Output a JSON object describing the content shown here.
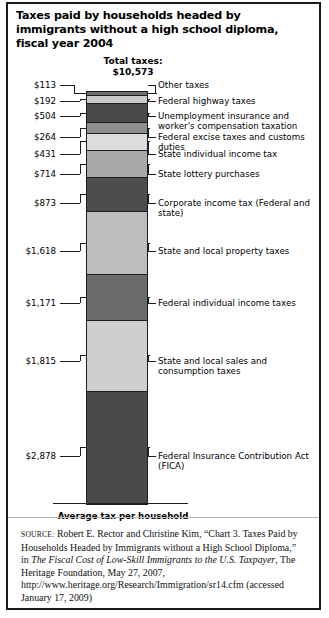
{
  "figure": {
    "title": "Taxes paid by households headed by immigrants without a high school diploma, fiscal year 2004",
    "total_label": "Total taxes:",
    "total_value": "$10,573",
    "axis_caption": "Average tax per household"
  },
  "source": {
    "keyword": "SOURCE:",
    "text_1": " Robert E. Rector and Christine Kim, “Chart 3. Taxes Paid by Households Headed by Immigrants without a High School Diploma,” in ",
    "italic": "The Fiscal Cost of Low-Skill Immigrants to the U.S. Taxpayer",
    "text_2": ", The Heritage Foundation, May 27, 2007, http://www.heritage.org/Research/Immigration/sr14.cfm (accessed January 17, 2009)"
  },
  "chart_data": {
    "type": "bar",
    "subtype": "stacked-single-column",
    "title": "Taxes paid by households headed by immigrants without a high school diploma, fiscal year 2004",
    "xlabel": "Average tax per household",
    "ylabel": "",
    "units": "US dollars per household per year",
    "total": 10573,
    "total_label": "$10,573",
    "categories": [
      "Other taxes",
      "Federal highway taxes",
      "Unemployment insurance and worker's compensation taxation",
      "Federal excise taxes and customs duties",
      "State individual income tax",
      "State lottery purchases",
      "Corporate income tax (Federal and state)",
      "State and local property taxes",
      "Federal individual income taxes",
      "State and local sales and consumption taxes",
      "Federal Insurance Contribution Act (FICA)"
    ],
    "values": [
      113,
      192,
      504,
      264,
      431,
      714,
      873,
      1618,
      1171,
      1815,
      2878
    ],
    "value_labels": [
      "$113",
      "$192",
      "$504",
      "$264",
      "$431",
      "$714",
      "$873",
      "$1,618",
      "$1,171",
      "$1,815",
      "$2,878"
    ],
    "colors": [
      "#6d6d6d",
      "#c9c9c9",
      "#4a4a4a",
      "#8e8e8e",
      "#dcdcdc",
      "#a8a8a8",
      "#4d4d4d",
      "#bdbdbd",
      "#6b6b6b",
      "#cfcfcf",
      "#4a4a4a"
    ],
    "order": "top-to-bottom",
    "grid": false,
    "legend": false,
    "ylim": [
      0,
      10573
    ]
  }
}
